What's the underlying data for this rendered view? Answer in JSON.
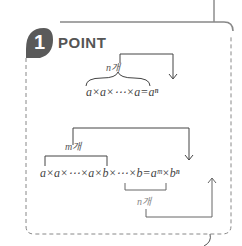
{
  "header": {
    "badge_number": "1",
    "title": "POINT"
  },
  "formula1": {
    "expression": "a×a×⋯×a=aⁿ",
    "count_label": "n개"
  },
  "formula2": {
    "expression": "a×a×⋯×a×b×⋯×b=aᵐ×bⁿ",
    "count_label_a": "m개",
    "count_label_b": "n개"
  },
  "colors": {
    "stroke": "#777777",
    "badge": "#666666",
    "text": "#444444"
  }
}
